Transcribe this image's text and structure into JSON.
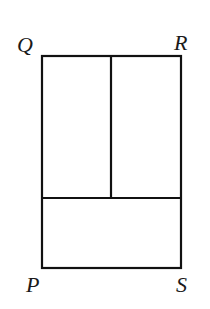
{
  "diagram": {
    "colors": {
      "stroke": "#111111",
      "background": "#ffffff",
      "label": "#1a1a1a"
    },
    "vertices": {
      "Q": {
        "label": "Q",
        "x": 42,
        "y": 56
      },
      "R": {
        "label": "R",
        "x": 181,
        "y": 56
      },
      "S": {
        "label": "S",
        "x": 181,
        "y": 268
      },
      "P": {
        "label": "P",
        "x": 42,
        "y": 268
      }
    },
    "dividers": [
      {
        "type": "vertical",
        "x": 111,
        "y1": 56,
        "y2": 198
      },
      {
        "type": "horizontal",
        "y": 198,
        "x1": 42,
        "x2": 181
      }
    ],
    "regions": [
      {
        "name": "top-left-rectangle"
      },
      {
        "name": "top-right-rectangle"
      },
      {
        "name": "bottom-rectangle"
      }
    ]
  }
}
